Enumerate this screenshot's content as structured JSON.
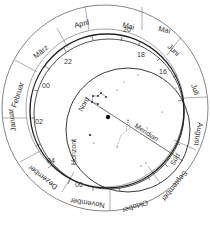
{
  "diagram": {
    "type": "planisphere",
    "months": [
      "Januar",
      "Februar",
      "März",
      "April",
      "Mai",
      "Juni",
      "Juli",
      "August",
      "September",
      "Oktober",
      "November",
      "Dezember"
    ],
    "hour_labels": [
      "22",
      "00",
      "02",
      "04",
      "06",
      "16",
      "18",
      "20"
    ],
    "horizon_label": "Horizont",
    "meridian_label": "Meridian",
    "north_label": "Nord",
    "south_label": "Süd"
  },
  "labels": {
    "months": {
      "januar": "Januar",
      "februar": "Februar",
      "maerz": "März",
      "april": "April",
      "mai": "Mai",
      "juni": "Juni",
      "juli": "Juli",
      "august": "August",
      "september": "September",
      "oktober": "Oktober",
      "november": "November",
      "dezember": "Dezember"
    },
    "hours": {
      "h22": "22",
      "h00": "00",
      "h02": "02",
      "h04": "04",
      "h06": "06",
      "h16": "16",
      "h18": "18",
      "h20": "20"
    },
    "horizon": "Horizont",
    "meridian": "Meridian",
    "north": "Nord",
    "south": "Süd"
  },
  "colors": {
    "line": "#444444",
    "text": "#333333",
    "star": "#222222",
    "background": "#ffffff"
  }
}
